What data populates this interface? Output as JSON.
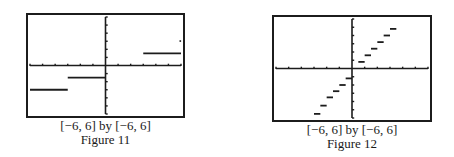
{
  "chart_data": [
    {
      "type": "line",
      "title": "Figure 11",
      "window": "[−6, 6] by [−6, 6]",
      "xlim": [
        -6,
        6
      ],
      "ylim": [
        -6,
        6
      ],
      "grid": false,
      "axes_ticks": {
        "x_step": 1,
        "y_step": 1
      },
      "description": "Step function graph with three horizontal segments and an isolated point",
      "segments": [
        {
          "x": [
            -6,
            -3
          ],
          "y": -3
        },
        {
          "x": [
            -3,
            0
          ],
          "y": -1.5
        },
        {
          "x": [
            3,
            6
          ],
          "y": 1.5
        }
      ],
      "points": [
        {
          "x": 6,
          "y": 3
        }
      ]
    },
    {
      "type": "line",
      "title": "Figure 12",
      "window": "[−6, 6] by [−6, 6]",
      "xlim": [
        -6,
        6
      ],
      "ylim": [
        -6,
        6
      ],
      "grid": false,
      "axes_ticks": {
        "x_step": 1,
        "y_step": 1
      },
      "description": "Greatest-integer-style step function with short dashes rising from lower-left to upper-right",
      "segments": [
        {
          "x": [
            -3.0,
            -2.5
          ],
          "y": -5.5
        },
        {
          "x": [
            -2.5,
            -2.0
          ],
          "y": -4.5
        },
        {
          "x": [
            -2.0,
            -1.5
          ],
          "y": -3.5
        },
        {
          "x": [
            -1.5,
            -1.0
          ],
          "y": -2.75
        },
        {
          "x": [
            -1.0,
            -0.5
          ],
          "y": -2.0
        },
        {
          "x": [
            -0.5,
            0.0
          ],
          "y": -1.2
        },
        {
          "x": [
            0.5,
            1.0
          ],
          "y": 0.8
        },
        {
          "x": [
            1.0,
            1.5
          ],
          "y": 1.6
        },
        {
          "x": [
            1.5,
            2.0
          ],
          "y": 2.4
        },
        {
          "x": [
            2.0,
            2.5
          ],
          "y": 3.2
        },
        {
          "x": [
            2.5,
            3.0
          ],
          "y": 4.0
        },
        {
          "x": [
            3.0,
            3.5
          ],
          "y": 4.8
        }
      ],
      "points": []
    }
  ],
  "figures": [
    {
      "window_caption": "[−6, 6] by [−6, 6]",
      "label": "Figure 11"
    },
    {
      "window_caption": "[−6, 6] by [−6, 6]",
      "label": "Figure 12"
    }
  ]
}
